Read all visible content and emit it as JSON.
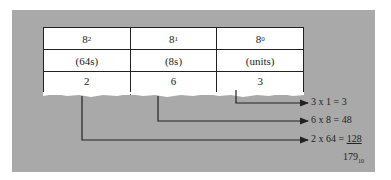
{
  "diagram": {
    "columns": [
      {
        "base": "8",
        "exponent": "2",
        "label": "(64s)",
        "digit": "2"
      },
      {
        "base": "8",
        "exponent": "1",
        "label": "(8s)",
        "digit": "6"
      },
      {
        "base": "8",
        "exponent": "0",
        "label": "(units)",
        "digit": "3"
      }
    ],
    "equations": [
      {
        "text": "3 x  1 =    3"
      },
      {
        "text": "6 x  8 =   48"
      },
      {
        "text": "2 x 64 = ",
        "product": "128"
      }
    ],
    "result": {
      "value": "179",
      "base": "10"
    },
    "colors": {
      "panel": "#a9a9a9",
      "table_bg": "#ffffff",
      "lines": "#222222"
    }
  }
}
